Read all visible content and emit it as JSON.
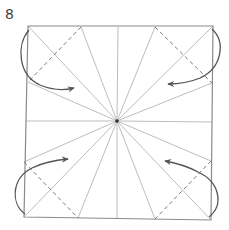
{
  "diagram": {
    "step_number": "8",
    "type": "origami-fold-diagram",
    "colors": {
      "edge": "#8a8a8a",
      "crease": "#b5b5b5",
      "valley_fold": "#7a7a7a",
      "arrow": "#555555",
      "center_point": "#333333"
    },
    "paper": {
      "corners": [
        [
          28,
          26
        ],
        [
          213,
          26
        ],
        [
          211,
          220
        ],
        [
          24,
          217
        ]
      ]
    },
    "center": [
      117,
      121
    ],
    "crease_endpoints": [
      [
        28,
        26
      ],
      [
        81,
        27
      ],
      [
        118,
        27
      ],
      [
        155,
        27
      ],
      [
        213,
        26
      ],
      [
        212,
        83
      ],
      [
        212,
        122
      ],
      [
        211,
        161
      ],
      [
        211,
        220
      ],
      [
        155,
        219
      ],
      [
        117,
        219
      ],
      [
        78,
        218
      ],
      [
        24,
        217
      ],
      [
        24,
        162
      ],
      [
        26,
        121
      ],
      [
        28,
        82
      ]
    ],
    "valley_folds": [
      {
        "from": [
          81,
          27
        ],
        "to": [
          28,
          82
        ]
      },
      {
        "from": [
          155,
          27
        ],
        "to": [
          212,
          83
        ]
      },
      {
        "from": [
          24,
          162
        ],
        "to": [
          78,
          218
        ]
      },
      {
        "from": [
          211,
          161
        ],
        "to": [
          155,
          219
        ]
      }
    ],
    "arrows": [
      {
        "position": "top-left",
        "path": "M 29 30 C 16 45, 18 75, 40 85 C 52 90, 62 91, 74 88"
      },
      {
        "position": "top-right",
        "path": "M 212 29 C 226 42, 222 68, 200 78 C 188 83, 178 84, 168 84"
      },
      {
        "position": "bottom-left",
        "path": "M 25 214 C 10 203, 12 178, 32 168 C 44 162, 56 160, 68 159"
      },
      {
        "position": "bottom-right",
        "path": "M 209 217 C 224 205, 220 182, 198 172 C 187 166, 176 163, 165 161"
      }
    ]
  }
}
